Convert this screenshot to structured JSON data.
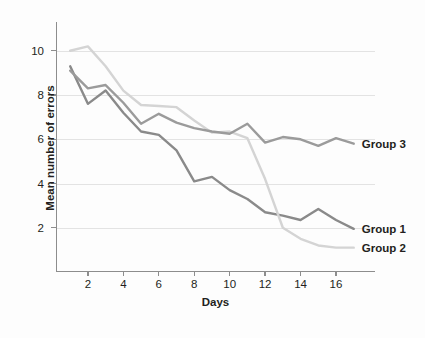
{
  "chart_data": {
    "type": "line",
    "title": "",
    "xlabel": "Days",
    "ylabel": "Mean number of errors",
    "xlim": [
      0.2,
      18.2
    ],
    "ylim": [
      0,
      11.3
    ],
    "xticks": [
      2,
      4,
      6,
      8,
      10,
      12,
      14,
      16
    ],
    "yticks": [
      2,
      4,
      6,
      8,
      10
    ],
    "grid": "horizontal",
    "legend_position": "inline-right-end-of-line",
    "x": [
      1,
      2,
      3,
      4,
      5,
      6,
      7,
      8,
      9,
      10,
      11,
      12,
      13,
      14,
      15,
      16,
      17
    ],
    "series": [
      {
        "name": "Group 1",
        "color": "#8a8a8a",
        "label": "Group 1",
        "values": [
          9.3,
          7.6,
          8.2,
          7.2,
          6.35,
          6.2,
          5.5,
          4.1,
          4.3,
          3.7,
          3.3,
          2.7,
          2.55,
          2.35,
          2.85,
          2.35,
          1.95
        ]
      },
      {
        "name": "Group 2",
        "color": "#d4d4d4",
        "label": "Group 2",
        "values": [
          10.0,
          10.2,
          9.3,
          8.2,
          7.55,
          7.5,
          7.45,
          6.85,
          6.3,
          6.35,
          6.05,
          4.2,
          2.0,
          1.5,
          1.2,
          1.1,
          1.1
        ]
      },
      {
        "name": "Group 3",
        "color": "#9b9b9b",
        "label": "Group 3",
        "values": [
          9.1,
          8.3,
          8.45,
          7.65,
          6.7,
          7.15,
          6.75,
          6.5,
          6.35,
          6.25,
          6.7,
          5.85,
          6.1,
          6.0,
          5.7,
          6.05,
          5.8
        ]
      }
    ]
  },
  "axes": {
    "ylabel": "Mean number of errors",
    "xlabel": "Days",
    "ytick_labels": [
      "10",
      "8",
      "6",
      "4",
      "2"
    ],
    "xtick_labels": [
      "2",
      "4",
      "6",
      "8",
      "10",
      "12",
      "14",
      "16"
    ]
  }
}
